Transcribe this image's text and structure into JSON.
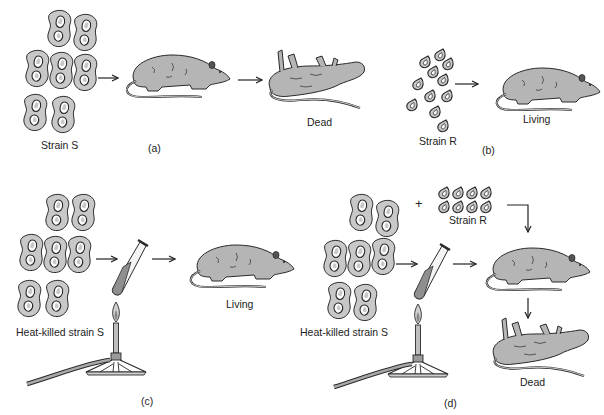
{
  "figure": {
    "panels": [
      {
        "id": "a",
        "panel_label": "(a)",
        "bacteria_label": "Strain S",
        "outcome_label": "Dead",
        "steps": [
          "Strain S",
          "injected mouse",
          "Dead"
        ]
      },
      {
        "id": "b",
        "panel_label": "(b)",
        "bacteria_label": "Strain R",
        "outcome_label": "Living",
        "steps": [
          "Strain R",
          "Living"
        ]
      },
      {
        "id": "c",
        "panel_label": "(c)",
        "bacteria_label": "Heat-killed strain S",
        "outcome_label": "Living",
        "steps": [
          "Heat-killed strain S",
          "test tube over burner",
          "Living"
        ]
      },
      {
        "id": "d",
        "panel_label": "(d)",
        "bacteria_label": "Heat-killed strain S",
        "plus_sign": "+",
        "added_bacteria_label": "Strain R",
        "outcome_label": "Dead",
        "steps": [
          "Heat-killed strain S",
          "test tube over burner",
          "+ Strain R",
          "mouse",
          "Dead"
        ]
      }
    ]
  },
  "colors": {
    "background": "#ffffff",
    "outline": "#2a2a2a",
    "cell_fill": "#c8c8c8",
    "mouse_fill": "#b5b5b5",
    "tube_liquid": "#8f8f8f"
  }
}
